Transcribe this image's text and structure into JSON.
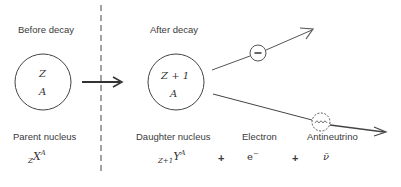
{
  "before": {
    "title": "Before decay",
    "nucleus": {
      "z": "Z",
      "a": "A"
    },
    "label": "Parent nucleus",
    "formula": {
      "pre": "Z",
      "sym": "X",
      "sup": "A"
    }
  },
  "after": {
    "title": "After decay",
    "nucleus": {
      "z": "Z + 1",
      "a": "A"
    },
    "label": "Daughter nucleus",
    "formula": {
      "pre": "Z+1",
      "sym": "Y",
      "sup": "A"
    }
  },
  "products": {
    "electron": {
      "label": "Electron",
      "symbol": "e",
      "charge": "−",
      "glyph": "−"
    },
    "antineutrino": {
      "label": "Antineutrino",
      "symbol": "ν̄"
    },
    "plus": "+"
  },
  "colors": {
    "line": "#555555",
    "text": "#333333"
  }
}
